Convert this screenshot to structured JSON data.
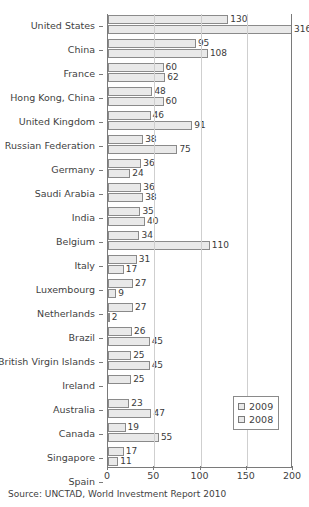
{
  "chart_data": {
    "type": "bar",
    "orientation": "horizontal",
    "title": "",
    "xlabel": "",
    "ylabel": "",
    "xlim": [
      0,
      200
    ],
    "xticks": [
      0,
      50,
      100,
      150,
      200
    ],
    "grid": "vertical",
    "legend_position": "bottom-right",
    "categories": [
      "United States",
      "China",
      "France",
      "Hong Kong, China",
      "United Kingdom",
      "Russian Federation",
      "Germany",
      "Saudi Arabia",
      "India",
      "Belgium",
      "Italy",
      "Luxembourg",
      "Netherlands",
      "Brazil",
      "British Virgin Islands",
      "Ireland",
      "Australia",
      "Canada",
      "Singapore",
      "Spain"
    ],
    "series": [
      {
        "name": "2009",
        "values": [
          130,
          95,
          60,
          48,
          46,
          38,
          36,
          36,
          35,
          34,
          31,
          27,
          27,
          26,
          25,
          25,
          23,
          19,
          17,
          15
        ]
      },
      {
        "name": "2008",
        "values": [
          316,
          108,
          62,
          60,
          91,
          75,
          24,
          38,
          40,
          110,
          17,
          9,
          2,
          45,
          45,
          0,
          47,
          55,
          11,
          73
        ]
      }
    ]
  },
  "legend": {
    "items": [
      {
        "label": "2009"
      },
      {
        "label": "2008"
      }
    ]
  },
  "footer": {
    "source": "Source: UNCTAD, World Investment Report 2010"
  }
}
